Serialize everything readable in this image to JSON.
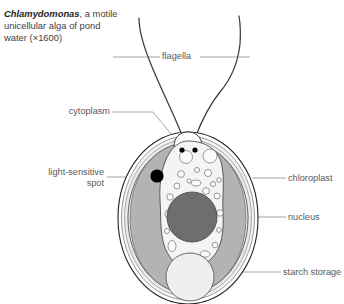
{
  "caption": {
    "species": "Chlamydomonas",
    "rest": ", a motile unicellular alga of pond water (×1600)"
  },
  "top_header": "",
  "labels": {
    "flagella": "flagella",
    "cytoplasm": "cytoplasm",
    "light_sensitive_1": "light-sensitive",
    "light_sensitive_2": "spot",
    "chloroplast": "chloroplast",
    "nucleus": "nucleus",
    "starch_storage": "starch storage"
  },
  "colors": {
    "outline": "#231f20",
    "leader": "#9a9b9d",
    "text": "#58595b",
    "cell_wall": "#e9e9ea",
    "chloroplast": "#b3b3b4",
    "cytoplasm": "#f0f0f0",
    "nucleus": "#6d6e70",
    "eyespot": "#000000",
    "starch": "#efefef",
    "background": "#ffffff"
  },
  "diagram": {
    "type": "biological-cell-diagram",
    "organism": "Chlamydomonas",
    "magnification": "×1600",
    "structures": [
      {
        "name": "flagella",
        "count": 2,
        "description": "two long whip-like threads emerging from the apex"
      },
      {
        "name": "cell wall",
        "description": "concentric outer boundary layers of the oval cell"
      },
      {
        "name": "cytoplasm",
        "description": "pale central region containing small vacuoles"
      },
      {
        "name": "chloroplast",
        "description": "cup-shaped mid-grey region lining the cell interior"
      },
      {
        "name": "nucleus",
        "description": "dark grey sphere at cell centre"
      },
      {
        "name": "light-sensitive spot",
        "description": "solid black dot (eyespot) on the upper left of the chloroplast"
      },
      {
        "name": "starch storage",
        "description": "large pale sphere in the lower part of the cell"
      },
      {
        "name": "basal bodies",
        "count": 2,
        "description": "two small black dots at the flagella bases"
      }
    ]
  }
}
